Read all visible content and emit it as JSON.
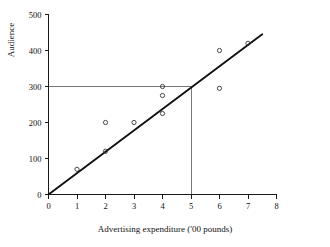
{
  "chart_data": {
    "type": "scatter",
    "title": "",
    "xlabel": "Advertising expenditure ('00 pounds)",
    "ylabel": "Audience",
    "xlim": [
      0,
      8
    ],
    "ylim": [
      0,
      500
    ],
    "grid": false,
    "legend": "none",
    "xticks": [
      0,
      1,
      2,
      3,
      4,
      5,
      6,
      7,
      8
    ],
    "xtick_labels": [
      "0",
      "1",
      "2",
      "3",
      "4",
      "5",
      "6",
      "7",
      "8"
    ],
    "yticks": [
      0,
      100,
      200,
      300,
      400,
      500
    ],
    "ytick_labels": [
      "0",
      "100",
      "200",
      "300",
      "400",
      "500"
    ],
    "series": [
      {
        "name": "Observations",
        "marker": "open-circle",
        "x": [
          1,
          2,
          2,
          3,
          4,
          4,
          4,
          6,
          6,
          7
        ],
        "y": [
          70,
          120,
          200,
          200,
          225,
          275,
          300,
          295,
          400,
          420
        ],
        "points": [
          {
            "x": 1,
            "y": 70
          },
          {
            "x": 2,
            "y": 120
          },
          {
            "x": 2,
            "y": 200
          },
          {
            "x": 3,
            "y": 200
          },
          {
            "x": 4,
            "y": 225
          },
          {
            "x": 4,
            "y": 275
          },
          {
            "x": 4,
            "y": 300
          },
          {
            "x": 6,
            "y": 295
          },
          {
            "x": 6,
            "y": 400
          },
          {
            "x": 7,
            "y": 420
          }
        ]
      }
    ],
    "fit_line": {
      "name": "Regression line",
      "from": {
        "x": 0,
        "y": 0
      },
      "to": {
        "x": 7.5,
        "y": 445
      },
      "slope": 59.3,
      "intercept": 0
    },
    "reference_lines": [
      {
        "name": "horizontal-reference",
        "orientation": "horizontal",
        "value": 300,
        "from": {
          "x": 0,
          "y": 300
        },
        "to": {
          "x": 5,
          "y": 300
        }
      },
      {
        "name": "vertical-reference",
        "orientation": "vertical",
        "value": 5,
        "from": {
          "x": 5,
          "y": 0
        },
        "to": {
          "x": 5,
          "y": 300
        }
      }
    ],
    "colors": {
      "axis": "#1a1a1a",
      "marker": "#333333",
      "fit_line": "#111111",
      "reference_line": "#777777",
      "background": "#ffffff"
    }
  }
}
